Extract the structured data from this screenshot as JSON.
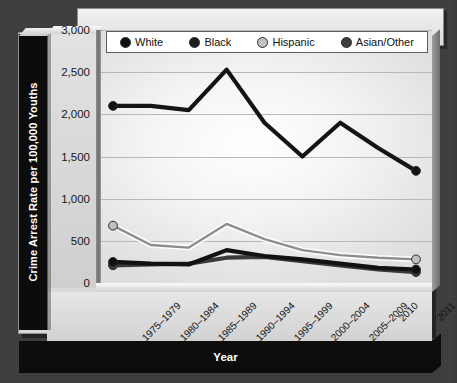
{
  "chart_data": {
    "type": "line",
    "title": "",
    "xlabel": "Year",
    "ylabel": "Crime Arrest Rate per 100,000 Youths",
    "ylim": [
      0,
      3000
    ],
    "ytick_labels": [
      "3,000",
      "2,500",
      "2,000",
      "1,500",
      "1,000",
      "500",
      "0"
    ],
    "ytick_values": [
      3000,
      2500,
      2000,
      1500,
      1000,
      500,
      0
    ],
    "grid": true,
    "legend_position": "top",
    "categories": [
      "1975–1979",
      "1980–1984",
      "1985–1989",
      "1990–1994",
      "1995–1999",
      "2000–2004",
      "2005–2009",
      "2010",
      "2011"
    ],
    "series": [
      {
        "name": "White",
        "color": "#111111",
        "marker_color": "#111111",
        "values": [
          250,
          230,
          220,
          390,
          320,
          280,
          230,
          180,
          160
        ]
      },
      {
        "name": "Black",
        "color": "#141414",
        "marker_color": "#141414",
        "values": [
          2100,
          2100,
          2050,
          2530,
          1900,
          1500,
          1900,
          1600,
          1330
        ]
      },
      {
        "name": "Hispanic",
        "color": "#8d8d8d",
        "marker_color": "#c0c0c0",
        "values": [
          680,
          450,
          420,
          700,
          520,
          390,
          330,
          300,
          280
        ]
      },
      {
        "name": "Asian/Other",
        "color": "#3a3a3a",
        "marker_color": "#3a3a3a",
        "values": [
          210,
          220,
          230,
          300,
          310,
          260,
          210,
          160,
          130
        ]
      }
    ]
  },
  "legend": {
    "items": [
      {
        "label": "White",
        "dot_color": "#111111"
      },
      {
        "label": "Black",
        "dot_color": "#1b1b1b"
      },
      {
        "label": "Hispanic",
        "dot_color": "#c2c2c2"
      },
      {
        "label": "Asian/Other",
        "dot_color": "#3d3d3d"
      }
    ]
  },
  "axes": {
    "y_title": "Crime Arrest Rate per 100,000 Youths",
    "x_title": "Year"
  },
  "colors": {
    "backdrop": "#3c3c3c",
    "panel": "#d9d9d9",
    "plot_light": "#ffffff",
    "gridline": "#b8b8b8",
    "axis_dark": "#0d0d0d"
  }
}
